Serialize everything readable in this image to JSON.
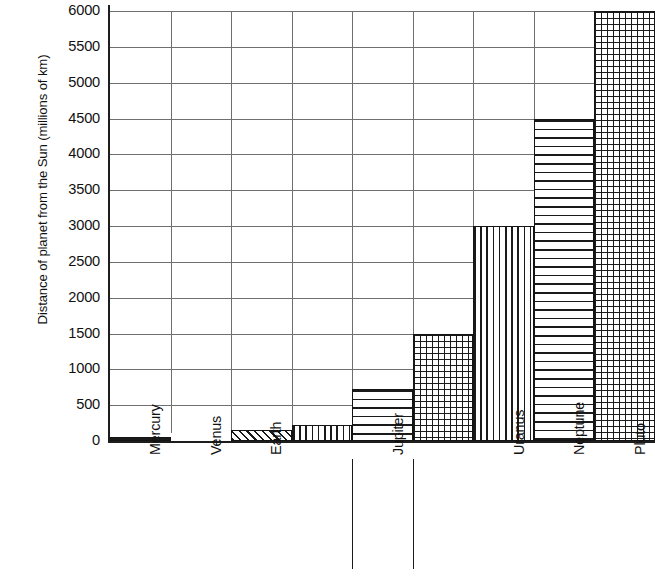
{
  "chart_data": {
    "type": "bar",
    "title": "",
    "subtitle": "",
    "xlabel": "",
    "ylabel": "Distance of planet from the Sun (millions of km)",
    "categories": [
      "Mercury",
      "Venus",
      "Earth",
      "",
      "Jupiter",
      "",
      "Uranus",
      "Neptune",
      "Pluto"
    ],
    "values": [
      58,
      108,
      150,
      228,
      720,
      1500,
      3000,
      4500,
      6000
    ],
    "bar_patterns": [
      "grid",
      "none",
      "diagonal-hatch",
      "vertical-lines",
      "horizontal-lines",
      "grid",
      "vertical-lines",
      "horizontal-lines",
      "grid"
    ],
    "ylim": [
      0,
      6000
    ],
    "y_ticks": [
      0,
      500,
      1000,
      1500,
      2000,
      2500,
      3000,
      3500,
      4000,
      4500,
      5000,
      5500,
      6000
    ],
    "y_tick_labels": [
      "0",
      "500",
      "1000",
      "1500",
      "2000",
      "2500",
      "3000",
      "3500",
      "4000",
      "4500",
      "5000",
      "5500",
      "6000"
    ],
    "grid": "both",
    "legend": "none",
    "annotations": [
      {
        "name": "unlabeled-category-4",
        "note": "blank x label slot between Earth and Jupiter"
      },
      {
        "name": "unlabeled-category-6",
        "note": "blank x label slot between Jupiter and Uranus"
      }
    ]
  },
  "axis": {
    "y_title": "Distance of planet from the Sun (millions of km)"
  },
  "colors": {
    "ink": "#1a1a1a",
    "grid": "#6f6f6f",
    "background": "#ffffff"
  }
}
